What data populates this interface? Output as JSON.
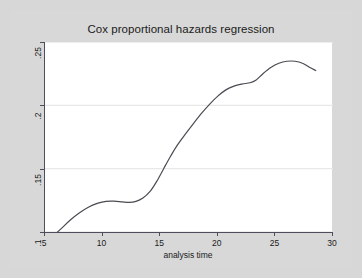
{
  "chart_data": {
    "type": "line",
    "title": "Cox proportional hazards regression",
    "xlabel": "analysis time",
    "ylabel": "Smoothed hazard function",
    "xlim": [
      5,
      30
    ],
    "ylim": [
      0.1,
      0.25
    ],
    "xticks": [
      "5",
      "10",
      "15",
      "20",
      "25",
      "30"
    ],
    "xtick_values": [
      5,
      10,
      15,
      20,
      25,
      30
    ],
    "yticks": [
      ".1",
      ".15",
      ".2",
      ".25"
    ],
    "ytick_values": [
      0.1,
      0.15,
      0.2,
      0.25
    ],
    "grid": "horizontal",
    "legend": "none",
    "line_color": "#4a4a52",
    "series": [
      {
        "name": "Smoothed hazard function",
        "x": [
          5.8,
          6.5,
          7.2,
          8.0,
          8.8,
          9.6,
          10.3,
          11.0,
          11.7,
          12.3,
          12.9,
          13.5,
          14.1,
          14.7,
          15.3,
          15.9,
          16.5,
          17.2,
          17.9,
          18.6,
          19.3,
          20.0,
          20.7,
          21.4,
          22.1,
          22.8,
          23.3,
          23.9,
          24.6,
          25.3,
          26.0,
          26.7,
          27.4,
          28.0,
          28.5
        ],
        "y": [
          0.0975,
          0.1035,
          0.1095,
          0.1152,
          0.1198,
          0.1228,
          0.1242,
          0.1243,
          0.1238,
          0.1234,
          0.1242,
          0.1268,
          0.1318,
          0.14,
          0.15,
          0.1598,
          0.1688,
          0.1775,
          0.1858,
          0.1938,
          0.201,
          0.2073,
          0.2122,
          0.2152,
          0.2168,
          0.2178,
          0.2198,
          0.2248,
          0.2298,
          0.2332,
          0.2348,
          0.2348,
          0.233,
          0.2298,
          0.2275
        ]
      }
    ]
  },
  "figure": {
    "background_color": "#d7d7d7",
    "plot_background_color": "#ffffff",
    "axis_color": "#4d4d5c",
    "gridline_color": "#e8e8e8"
  }
}
